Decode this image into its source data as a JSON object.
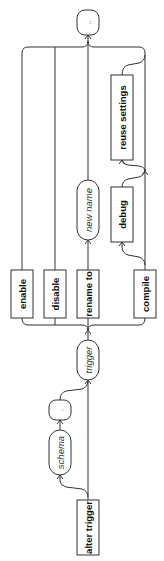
{
  "diagram": {
    "type": "railroad",
    "orientation": "rotated-90-ccw",
    "start": {
      "keyword": "alter trigger"
    },
    "optional_prefix": [
      {
        "kind": "identifier",
        "label": "schema"
      },
      {
        "kind": "symbol",
        "label": "."
      }
    ],
    "name": {
      "kind": "identifier",
      "label": "trigger"
    },
    "branches": [
      {
        "keyword": "enable"
      },
      {
        "keyword": "disable"
      },
      {
        "keyword": "rename to",
        "followed_by": {
          "kind": "identifier",
          "label": "new name"
        }
      },
      {
        "keyword": "compile",
        "options": [
          {
            "keyword": "debug"
          },
          {
            "keyword": "reuse settings"
          }
        ]
      }
    ],
    "end": {
      "kind": "symbol",
      "label": ".."
    }
  }
}
